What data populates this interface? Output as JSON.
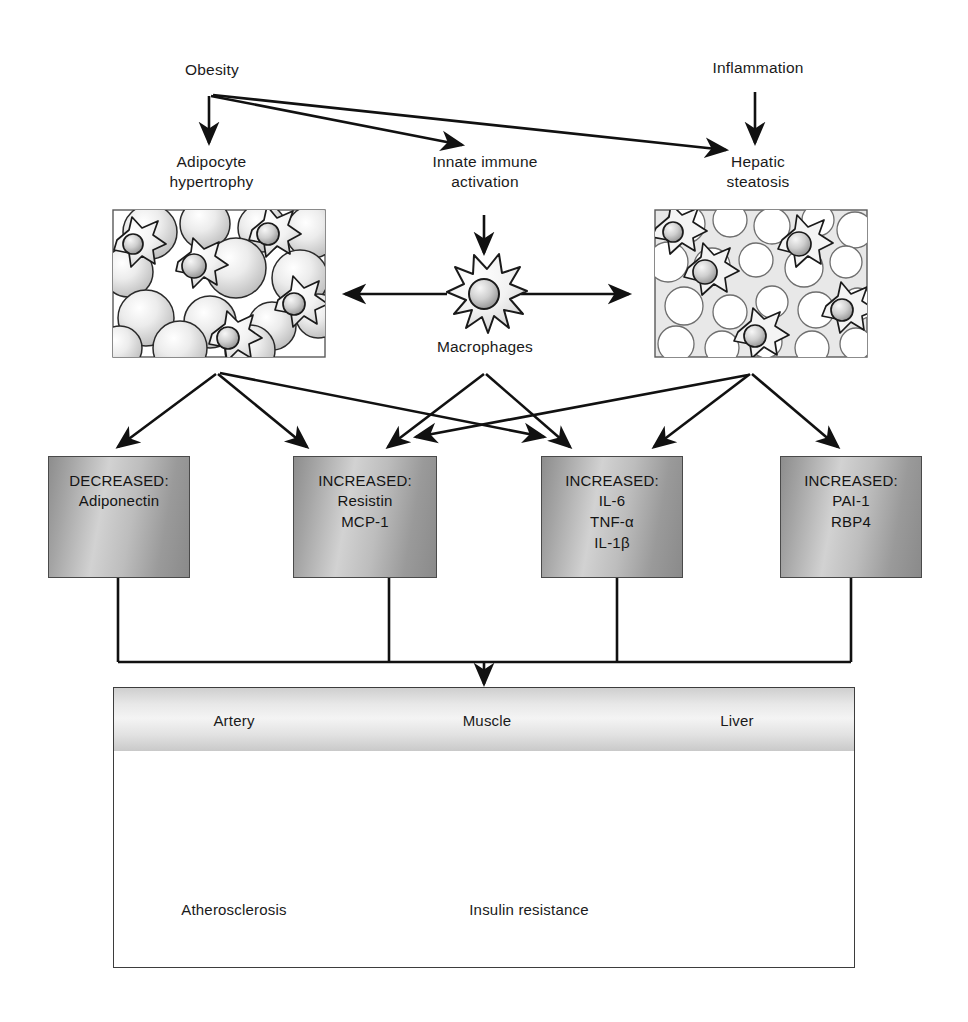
{
  "diagram": {
    "top_nodes": [
      {
        "id": "obesity",
        "label": "Obesity"
      },
      {
        "id": "inflammation",
        "label": "Inflammation"
      }
    ],
    "second_row": [
      {
        "id": "adipocyte-hypertrophy",
        "label": "Adipocyte\nhypertrophy"
      },
      {
        "id": "innate-immune-activation",
        "label": "Innate immune\nactivation"
      },
      {
        "id": "hepatic-steatosis",
        "label": "Hepatic\nsteatosis"
      }
    ],
    "macrophage": {
      "label": "Macrophages"
    },
    "micrographs": [
      {
        "id": "adipose-tissue-hypertrophy",
        "caption": ""
      },
      {
        "id": "hepatic-steatosis-tissue",
        "caption": ""
      }
    ],
    "mediator_boxes": [
      {
        "id": "box-adiponectin",
        "header": "DECREASED:",
        "items": [
          "Adiponectin"
        ]
      },
      {
        "id": "box-resistin-mcp1",
        "header": "INCREASED:",
        "items": [
          "Resistin",
          "MCP-1"
        ]
      },
      {
        "id": "box-il6-tnfa-il1b",
        "header": "INCREASED:",
        "items": [
          "IL-6",
          "TNF-α",
          "IL-1β"
        ]
      },
      {
        "id": "box-pai1-rbp4",
        "header": "INCREASED:",
        "items": [
          "PAI-1",
          "RBP4"
        ]
      }
    ],
    "outcome_panel": {
      "organs": [
        {
          "id": "artery",
          "label": "Artery"
        },
        {
          "id": "muscle",
          "label": "Muscle"
        },
        {
          "id": "liver",
          "label": "Liver"
        }
      ],
      "outcomes": [
        {
          "id": "atherosclerosis",
          "label": "Atherosclerosis"
        },
        {
          "id": "insulin-resistance",
          "label": "Insulin resistance"
        }
      ]
    },
    "colors": {
      "stroke": "#111111",
      "box_border": "#4a4a4a",
      "box_fill_light": "#d2d2d2",
      "box_fill_dark": "#8a8a8a",
      "panel_border": "#3d3d3d",
      "background": "#ffffff"
    }
  }
}
